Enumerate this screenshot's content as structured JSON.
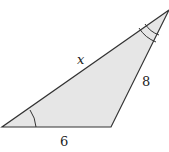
{
  "diagram": {
    "type": "triangle",
    "fill_color": "#e6e6e6",
    "stroke_color": "#333333",
    "vertices": {
      "bottom_left": [
        2,
        127
      ],
      "bottom_right": [
        111,
        127
      ],
      "top_right": [
        169,
        10
      ]
    },
    "labels": {
      "hypotenuse": "x",
      "right_side": "8",
      "bottom_side": "6"
    },
    "angle_marks": {
      "bottom_left": "single arc",
      "top_right": "double arc"
    }
  }
}
